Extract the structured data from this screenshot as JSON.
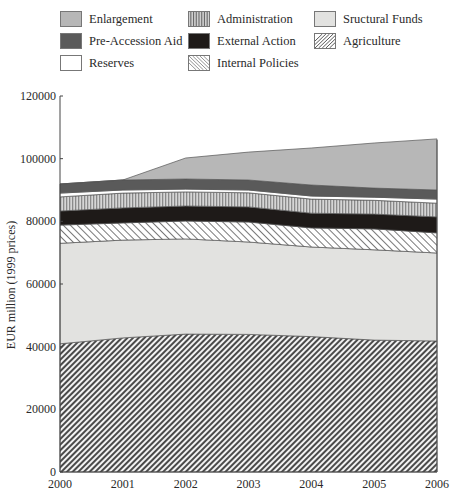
{
  "legend": {
    "items": [
      {
        "label": "Enlargement",
        "key": "enlargement"
      },
      {
        "label": "Administration",
        "key": "administration"
      },
      {
        "label": "Sructural Funds",
        "key": "structural"
      },
      {
        "label": "Pre-Accession Aid",
        "key": "preaccession"
      },
      {
        "label": "External Action",
        "key": "external"
      },
      {
        "label": "Agriculture",
        "key": "agriculture"
      },
      {
        "label": "Reserves",
        "key": "reserves"
      },
      {
        "label": "Internal Policies",
        "key": "internal"
      }
    ]
  },
  "axes": {
    "ylabel": "EUR million (1999 prices)",
    "yticks": [
      "0",
      "20000",
      "40000",
      "60000",
      "80000",
      "100000",
      "120000"
    ],
    "xticks": [
      "2000",
      "2001",
      "2002",
      "2003",
      "2004",
      "2005",
      "2006"
    ]
  },
  "colors": {
    "enlargement": "#b7b7b7",
    "preaccession": "#5a5a5a",
    "reserves": "#ffffff",
    "administration": "#9a9a9a",
    "external": "#1e1a18",
    "internal": "#ffffff",
    "structural": "#e2e2e0",
    "agriculture": "#4a4a4a"
  },
  "chart_data": {
    "type": "area",
    "stacked": true,
    "title": "",
    "xlabel": "",
    "ylabel": "EUR million (1999 prices)",
    "x": [
      2000,
      2001,
      2002,
      2003,
      2004,
      2005,
      2006
    ],
    "ylim": [
      0,
      120000
    ],
    "yticks": [
      0,
      20000,
      40000,
      60000,
      80000,
      100000,
      120000
    ],
    "grid": false,
    "legend_position": "top",
    "series": [
      {
        "name": "Agriculture",
        "values": [
          40900,
          42800,
          44000,
          43900,
          43200,
          42100,
          41800
        ]
      },
      {
        "name": "Sructural Funds",
        "values": [
          32100,
          31200,
          30400,
          29500,
          28600,
          28800,
          28100
        ]
      },
      {
        "name": "Internal Policies",
        "values": [
          5800,
          5500,
          5700,
          6400,
          6100,
          6700,
          6400
        ]
      },
      {
        "name": "External Action",
        "values": [
          4500,
          4800,
          4800,
          4800,
          4700,
          4700,
          5100
        ]
      },
      {
        "name": "Administration",
        "values": [
          4500,
          4700,
          4500,
          4500,
          4500,
          4400,
          4400
        ]
      },
      {
        "name": "Reserves",
        "values": [
          1200,
          1000,
          900,
          900,
          1000,
          1000,
          1300
        ]
      },
      {
        "name": "Pre-Accession Aid",
        "values": [
          2900,
          3200,
          3200,
          3200,
          3500,
          2900,
          2900
        ]
      },
      {
        "name": "Enlargement",
        "values": [
          0,
          0,
          6700,
          8900,
          11800,
          14400,
          16300
        ]
      }
    ]
  }
}
